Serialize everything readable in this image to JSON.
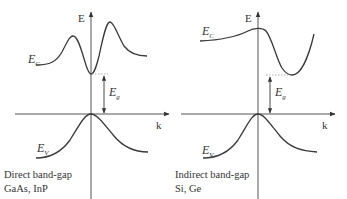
{
  "panels": [
    {
      "id": "direct",
      "axis_e_label": "E",
      "axis_k_label": "k",
      "conduction_band": {
        "symbol": "E",
        "subscript": "C"
      },
      "valence_band": {
        "symbol": "E",
        "subscript": "V"
      },
      "gap": {
        "symbol": "E",
        "subscript": "g"
      },
      "caption_line1": "Direct band-gap",
      "caption_line2": "GaAs, InP"
    },
    {
      "id": "indirect",
      "axis_e_label": "E",
      "axis_k_label": "k",
      "conduction_band": {
        "symbol": "E",
        "subscript": "C"
      },
      "valence_band": {
        "symbol": "E",
        "subscript": "V"
      },
      "gap": {
        "symbol": "E",
        "subscript": "g"
      },
      "caption_line1": "Indirect band-gap",
      "caption_line2": "Si, Ge"
    }
  ],
  "colors": {
    "line": "#3a3a3a",
    "dotted": "#9a9a9a",
    "axis": "#555555"
  }
}
